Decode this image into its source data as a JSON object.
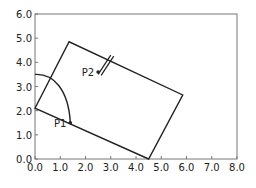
{
  "diagram": {
    "type": "geometry-plot",
    "axes": {
      "xlim": [
        0,
        8
      ],
      "ylim": [
        0,
        6
      ],
      "x_ticks": [
        "0.0",
        "1.0",
        "2.0",
        "3.0",
        "4.0",
        "5.0",
        "6.0",
        "7.0",
        "8.0"
      ],
      "y_ticks": [
        "0.0",
        "1.0",
        "2.0",
        "3.0",
        "4.0",
        "5.0",
        "6.0"
      ]
    },
    "rectangle": {
      "corners": [
        [
          0.0,
          2.1
        ],
        [
          1.35,
          4.85
        ],
        [
          5.85,
          2.65
        ],
        [
          4.5,
          0.0
        ]
      ]
    },
    "arc": {
      "start": [
        0.0,
        3.5
      ],
      "end": [
        1.4,
        1.5
      ]
    },
    "points": [
      {
        "label": "P1",
        "x": 1.4,
        "y": 1.5
      },
      {
        "label": "P2",
        "x": 2.5,
        "y": 3.6
      }
    ],
    "arrow": {
      "from": [
        2.5,
        3.5
      ],
      "to": [
        3.0,
        4.3
      ]
    },
    "colors": {
      "line": "#222222",
      "frame": "#777777",
      "background": "#ffffff"
    }
  }
}
